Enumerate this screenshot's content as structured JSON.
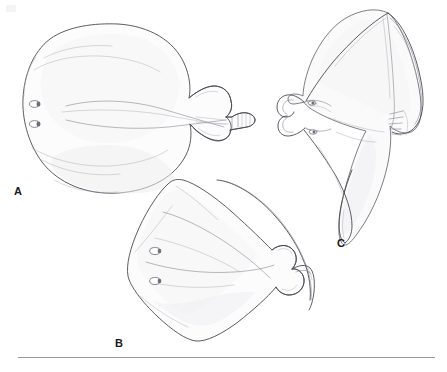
{
  "figure": {
    "type": "scientific-illustration-plate",
    "background_color": "#ffffff",
    "ink_color": "#4a4a52",
    "panel_labels": [
      {
        "id": "A",
        "label": "A",
        "subject": "ray-dorsal-view-rounded-disc"
      },
      {
        "id": "B",
        "label": "B",
        "subject": "ray-dorsal-view-rhomboid-disc"
      },
      {
        "id": "C",
        "label": "C",
        "subject": "devil-ray-ventral-view-cephalic-lobes"
      }
    ],
    "caption_rule": {
      "visible": true,
      "color": "#9a9a9a"
    },
    "anatomy_labels": {
      "eye": "eye",
      "spiracle": "spiracle",
      "gill_slits": "gill-slits",
      "cephalic_lobe": "cephalic-lobe",
      "pelvic_fin": "pelvic-fin",
      "caudal_fin": "caudal-fin",
      "tail": "tail"
    }
  }
}
